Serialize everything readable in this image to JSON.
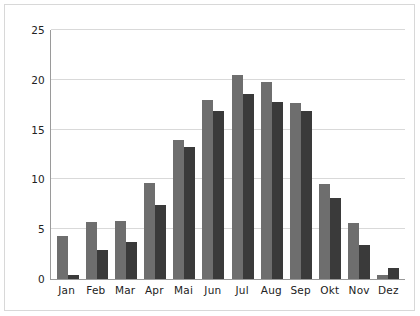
{
  "chart_data": {
    "type": "bar",
    "title": "",
    "subtitle": "",
    "xlabel": "",
    "ylabel": "",
    "categories": [
      "Jan",
      "Feb",
      "Mar",
      "Apr",
      "Mai",
      "Jun",
      "Jul",
      "Aug",
      "Sep",
      "Okt",
      "Nov",
      "Dez"
    ],
    "series": [
      {
        "name": "series-1",
        "color": "#6e6e6e",
        "values": [
          4.3,
          5.7,
          5.8,
          9.6,
          14.0,
          18.0,
          20.5,
          19.8,
          17.7,
          9.5,
          5.6,
          0.4
        ]
      },
      {
        "name": "series-2",
        "color": "#3a3a3a",
        "values": [
          0.4,
          2.9,
          3.7,
          7.4,
          13.3,
          16.9,
          18.6,
          17.8,
          16.9,
          8.1,
          3.4,
          1.1
        ]
      }
    ],
    "ylim": [
      0,
      25
    ],
    "ytick_values": [
      0,
      5,
      10,
      15,
      20,
      25
    ],
    "ytick_labels": [
      "0",
      "5",
      "10",
      "15",
      "20",
      "25"
    ],
    "grid": true,
    "grid_axis": "y",
    "legend": false,
    "legend_position": "none",
    "axis_color": "#9a9a9a",
    "grid_color": "#d9d9d9",
    "background": "#ffffff",
    "frame_border_color": "#d8d8d8"
  }
}
